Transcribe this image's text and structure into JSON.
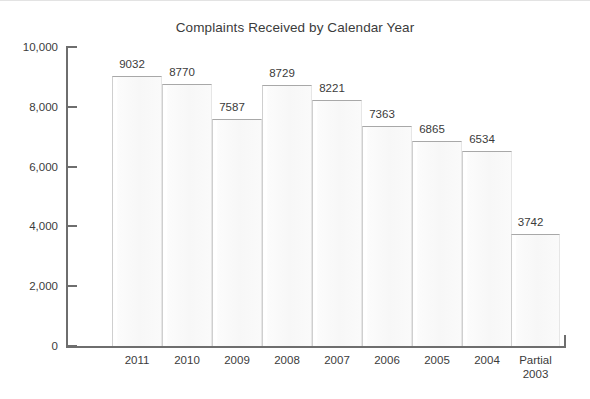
{
  "chart_data": {
    "type": "bar",
    "title": "Complaints Received by Calendar Year",
    "xlabel": "",
    "ylabel": "",
    "categories": [
      "2011",
      "2010",
      "2009",
      "2008",
      "2007",
      "2006",
      "2005",
      "2004",
      "Partial\n2003"
    ],
    "category_lines": [
      [
        "2011"
      ],
      [
        "2010"
      ],
      [
        "2009"
      ],
      [
        "2008"
      ],
      [
        "2007"
      ],
      [
        "2006"
      ],
      [
        "2005"
      ],
      [
        "2004"
      ],
      [
        "Partial",
        "2003"
      ]
    ],
    "values": [
      9032,
      8770,
      7587,
      8729,
      8221,
      7363,
      6865,
      6534,
      3742
    ],
    "value_labels": [
      "9032",
      "8770",
      "7587",
      "8729",
      "8221",
      "7363",
      "6865",
      "6534",
      "3742"
    ],
    "ylim": [
      0,
      10000
    ],
    "ytick_values": [
      0,
      2000,
      4000,
      6000,
      8000,
      10000
    ],
    "ytick_labels": [
      "0",
      "2,000",
      "4,000",
      "6,000",
      "8,000",
      "10,000"
    ],
    "grid": false,
    "legend": false,
    "colors": {
      "bar_fill": "#f8f8f8",
      "bar_edge": "#a8a8a8",
      "axis": "#6e6e6e",
      "text": "#3b3b3b",
      "background": "#ffffff"
    }
  }
}
